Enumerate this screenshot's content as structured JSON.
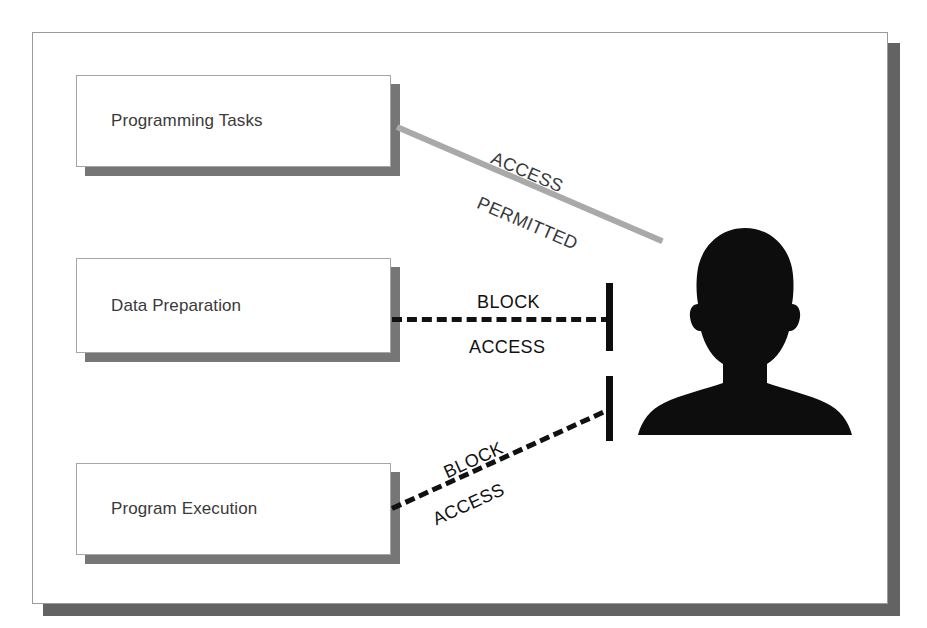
{
  "diagram": {
    "colors": {
      "frame_border": "#9a9a9a",
      "frame_shadow": "#636363",
      "node_shadow": "#767676",
      "node_border": "#a6a6a6",
      "node_text": "#3a3a3a",
      "permitted_line": "#a9a9a9",
      "blocked_line": "#111111",
      "silhouette": "#0d0d0d"
    },
    "nodes": [
      {
        "id": "programming-tasks",
        "label": "Programming Tasks"
      },
      {
        "id": "data-preparation",
        "label": "Data Preparation"
      },
      {
        "id": "program-execution",
        "label": "Program Execution"
      }
    ],
    "edges": [
      {
        "id": "access-permitted",
        "from": "programming-tasks",
        "to": "user",
        "style": "solid",
        "status": "permitted",
        "label_line_1": "ACCESS",
        "label_line_2": "PERMITTED"
      },
      {
        "id": "block-access-data-preparation",
        "from": "data-preparation",
        "to": "user",
        "style": "dashed",
        "status": "blocked",
        "label_line_1": "BLOCK",
        "label_line_2": "ACCESS"
      },
      {
        "id": "block-access-program-execution",
        "from": "program-execution",
        "to": "user",
        "style": "dashed",
        "status": "blocked",
        "label_line_1": "BLOCK",
        "label_line_2": "ACCESS"
      }
    ],
    "actor": {
      "id": "user",
      "icon": "person-silhouette-icon"
    }
  }
}
